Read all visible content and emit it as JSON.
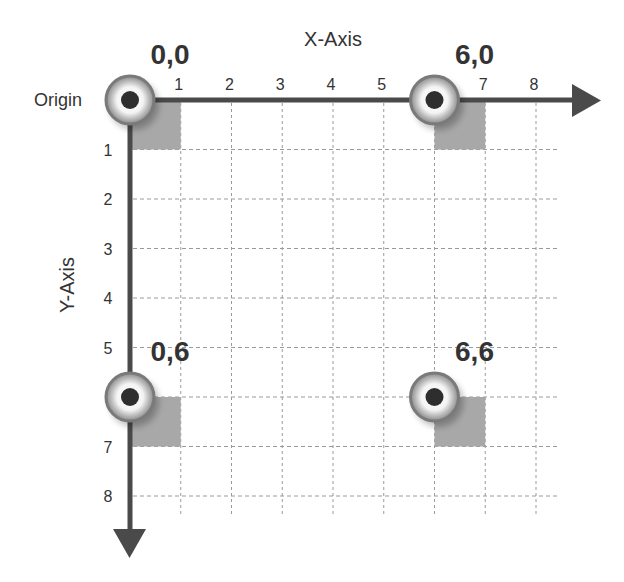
{
  "diagram": {
    "title_x_axis": "X-Axis",
    "title_y_axis": "Y-Axis",
    "origin_label": "Origin",
    "x_ticks": [
      "1",
      "2",
      "3",
      "4",
      "5",
      "6",
      "7",
      "8"
    ],
    "y_ticks": [
      "1",
      "2",
      "3",
      "4",
      "5",
      "6",
      "7",
      "8"
    ],
    "x_tick_visible": [
      true,
      true,
      true,
      true,
      true,
      false,
      true,
      true
    ],
    "y_tick_visible": [
      true,
      true,
      true,
      true,
      true,
      false,
      true,
      true
    ],
    "points": [
      {
        "label": "0,0",
        "x": 0,
        "y": 0
      },
      {
        "label": "6,0",
        "x": 6,
        "y": 0
      },
      {
        "label": "0,6",
        "x": 0,
        "y": 6
      },
      {
        "label": "6,6",
        "x": 6,
        "y": 6
      }
    ],
    "colors": {
      "axis": "#4a4a4a",
      "grid": "#9a9a9a",
      "shade": "#a8a8a8",
      "ring": "#7a7a7a",
      "dot": "#2e2e2e",
      "text": "#333333"
    }
  }
}
